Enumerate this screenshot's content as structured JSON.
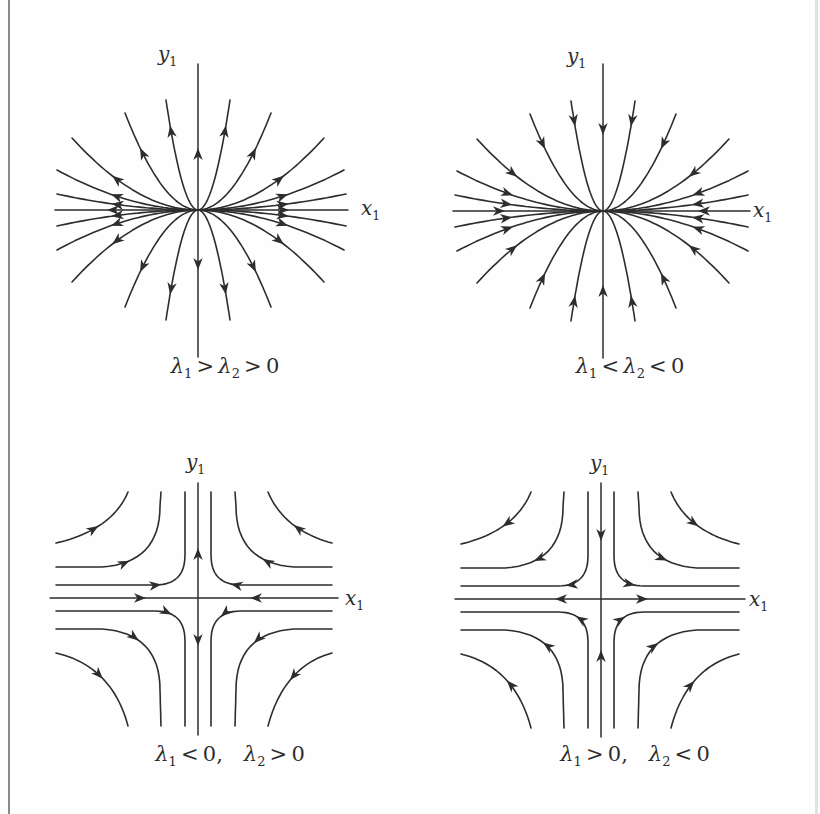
{
  "page": {
    "background": "#fefefe",
    "ink_color": "#2d2d2d",
    "left_border_color": "#8a8a8a",
    "right_border_color": "#e2e2e2"
  },
  "figure": {
    "panels": [
      {
        "id": "unstable-node",
        "type": "node",
        "flow": "outward",
        "y_axis_label": {
          "base": "y",
          "sub": "1"
        },
        "x_axis_label": {
          "base": "x",
          "sub": "1"
        },
        "caption_parts": [
          "λ",
          "1",
          " > ",
          "λ",
          "2",
          " > 0"
        ]
      },
      {
        "id": "stable-node",
        "type": "node",
        "flow": "inward",
        "y_axis_label": {
          "base": "y",
          "sub": "1"
        },
        "x_axis_label": {
          "base": "x",
          "sub": "1"
        },
        "caption_parts": [
          "λ",
          "1",
          " < ",
          "λ",
          "2",
          " < 0"
        ]
      },
      {
        "id": "saddle-x-stable",
        "type": "saddle",
        "stable_axis": "x",
        "y_axis_label": {
          "base": "y",
          "sub": "1"
        },
        "x_axis_label": {
          "base": "x",
          "sub": "1"
        },
        "caption_parts": [
          "λ",
          "1",
          " < 0,  ",
          "λ",
          "2",
          " > 0"
        ]
      },
      {
        "id": "saddle-y-stable",
        "type": "saddle",
        "stable_axis": "y",
        "y_axis_label": {
          "base": "y",
          "sub": "1"
        },
        "x_axis_label": {
          "base": "x",
          "sub": "1"
        },
        "caption_parts": [
          "λ",
          "1",
          " > 0,  ",
          "λ",
          "2",
          " < 0"
        ]
      }
    ]
  }
}
